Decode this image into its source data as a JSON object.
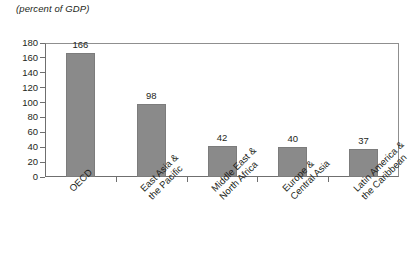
{
  "chart_data": {
    "type": "bar",
    "title": "",
    "subtitle": "(percent of GDP)",
    "xlabel": "",
    "ylabel": "",
    "ylim": [
      0,
      180
    ],
    "ytick_step": 20,
    "grid": false,
    "legend": "none",
    "bar_color": "#8a8a8a",
    "categories": [
      "OECD",
      "East Asia & the Pacific",
      "Middle East & North Africa",
      "Europe & Central Asia",
      "Latin America & the Caribbean"
    ],
    "category_lines": [
      [
        "OECD",
        ""
      ],
      [
        "East Asia &",
        "the Pacific"
      ],
      [
        "Middle East &",
        "North Africa"
      ],
      [
        "Europe &",
        "Central Asia"
      ],
      [
        "Latin America &",
        "the Caribbean"
      ]
    ],
    "values": [
      166,
      98,
      42,
      40,
      37
    ],
    "value_labels": [
      "166",
      "98",
      "42",
      "40",
      "37"
    ],
    "yticks": [
      {
        "value": 180,
        "label": "180"
      },
      {
        "value": 160,
        "label": "160"
      },
      {
        "value": 140,
        "label": "140"
      },
      {
        "value": 120,
        "label": "120"
      },
      {
        "value": 100,
        "label": "100"
      },
      {
        "value": 80,
        "label": "80"
      },
      {
        "value": 60,
        "label": "60"
      },
      {
        "value": 40,
        "label": "40"
      },
      {
        "value": 20,
        "label": "20"
      },
      {
        "value": 0,
        "label": "0"
      }
    ]
  }
}
